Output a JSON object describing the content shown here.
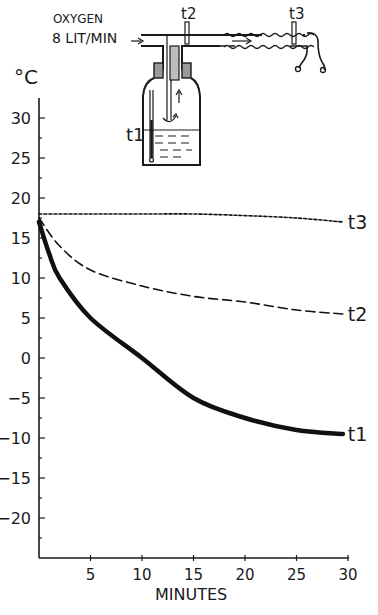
{
  "diagram": {
    "inlet_label_line1": "OXYGEN",
    "inlet_label_line2": "8 LIT/MIN",
    "thermometer_labels": [
      "t1",
      "t2",
      "t3"
    ]
  },
  "chart_data": {
    "type": "line",
    "title": "",
    "xlabel": "MINUTES",
    "ylabel": "°C",
    "xlim": [
      0,
      30
    ],
    "ylim": [
      -25,
      32
    ],
    "x_ticks": [
      5,
      10,
      15,
      20,
      25,
      30
    ],
    "y_ticks": [
      30,
      25,
      20,
      15,
      10,
      5,
      0,
      -5,
      -10,
      -15,
      -20
    ],
    "grid": false,
    "legend": "inline labels at line ends",
    "series": [
      {
        "name": "t3",
        "style": "dotted",
        "x": [
          0,
          5,
          10,
          15,
          20,
          25,
          29.5
        ],
        "values": [
          18,
          18,
          18,
          18,
          17.8,
          17.5,
          17
        ]
      },
      {
        "name": "t2",
        "style": "dashed",
        "x": [
          0,
          2,
          5,
          10,
          15,
          20,
          25,
          29.5
        ],
        "values": [
          17.5,
          14,
          11,
          9,
          7.7,
          7,
          6,
          5.5
        ]
      },
      {
        "name": "t1",
        "style": "solid-thick",
        "x": [
          0,
          1,
          2,
          5,
          10,
          15,
          20,
          25,
          29.5
        ],
        "values": [
          17,
          13,
          10,
          5,
          0,
          -5,
          -7.5,
          -9,
          -9.5
        ]
      }
    ]
  }
}
